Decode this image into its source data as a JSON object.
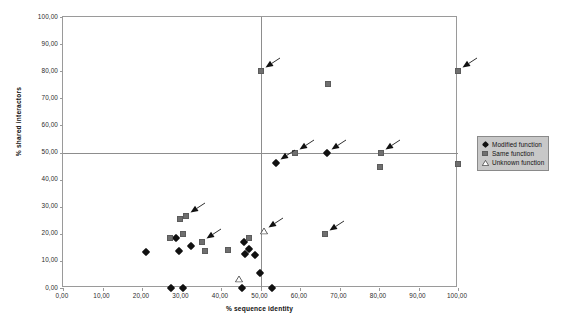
{
  "chart_data": {
    "type": "scatter",
    "title": "",
    "xlabel": "% sequence identity",
    "ylabel": "% shared interactors",
    "xlim": [
      0,
      100
    ],
    "ylim": [
      0,
      100
    ],
    "xticks": [
      "0,00",
      "10,00",
      "20,00",
      "30,00",
      "40,00",
      "50,00",
      "60,00",
      "70,00",
      "80,00",
      "90,00",
      "100,00"
    ],
    "xtick_values": [
      0,
      10,
      20,
      30,
      40,
      50,
      60,
      70,
      80,
      90,
      100
    ],
    "yticks": [
      "0,00",
      "10,00",
      "20,00",
      "30,00",
      "40,00",
      "50,00",
      "60,00",
      "70,00",
      "80,00",
      "90,00",
      "100,00"
    ],
    "ytick_values": [
      0,
      10,
      20,
      30,
      40,
      50,
      60,
      70,
      80,
      90,
      100
    ],
    "grid": false,
    "reference_lines": {
      "horizontal": [
        50
      ],
      "vertical": [
        50
      ]
    },
    "legend_position": "right",
    "series": [
      {
        "name": "Modified function",
        "marker": "diamond",
        "color": "#111111",
        "points": [
          {
            "x": 21.0,
            "y": 13.3
          },
          {
            "x": 27.3,
            "y": 0.0
          },
          {
            "x": 28.7,
            "y": 18.5
          },
          {
            "x": 29.3,
            "y": 13.7
          },
          {
            "x": 30.3,
            "y": 0.0
          },
          {
            "x": 32.3,
            "y": 15.5
          },
          {
            "x": 45.3,
            "y": 0.0
          },
          {
            "x": 45.8,
            "y": 17.0
          },
          {
            "x": 46.0,
            "y": 12.6
          },
          {
            "x": 47.0,
            "y": 14.3
          },
          {
            "x": 48.6,
            "y": 12.0
          },
          {
            "x": 49.8,
            "y": 5.4
          },
          {
            "x": 53.0,
            "y": 0.0
          },
          {
            "x": 53.8,
            "y": 46.2
          },
          {
            "x": 66.8,
            "y": 49.8
          }
        ]
      },
      {
        "name": "Same function",
        "marker": "square",
        "color": "#6f6f6f",
        "points": [
          {
            "x": 27.0,
            "y": 18.5
          },
          {
            "x": 29.6,
            "y": 25.4
          },
          {
            "x": 31.2,
            "y": 26.6
          },
          {
            "x": 30.5,
            "y": 20.0
          },
          {
            "x": 35.3,
            "y": 17.0
          },
          {
            "x": 36.0,
            "y": 13.8
          },
          {
            "x": 41.8,
            "y": 13.9
          },
          {
            "x": 47.0,
            "y": 18.4
          },
          {
            "x": 50.0,
            "y": 80.0
          },
          {
            "x": 58.8,
            "y": 49.8
          },
          {
            "x": 66.3,
            "y": 20.0
          },
          {
            "x": 67.0,
            "y": 75.2
          },
          {
            "x": 80.4,
            "y": 49.8
          },
          {
            "x": 80.2,
            "y": 44.5
          },
          {
            "x": 100.0,
            "y": 80.0
          },
          {
            "x": 100.0,
            "y": 45.6
          }
        ]
      },
      {
        "name": "Unknown function",
        "marker": "triangle",
        "color": "#ffffff",
        "points": [
          {
            "x": 44.6,
            "y": 3.3
          },
          {
            "x": 51.0,
            "y": 21.0
          }
        ]
      }
    ],
    "annotations": [
      {
        "label": "arrow",
        "target_x": 50.0,
        "target_y": 80.0
      },
      {
        "label": "arrow",
        "target_x": 100.0,
        "target_y": 80.0
      },
      {
        "label": "arrow",
        "target_x": 58.8,
        "target_y": 49.8
      },
      {
        "label": "arrow",
        "target_x": 66.8,
        "target_y": 49.8
      },
      {
        "label": "arrow",
        "target_x": 80.4,
        "target_y": 49.8
      },
      {
        "label": "arrow",
        "target_x": 31.2,
        "target_y": 26.6
      },
      {
        "label": "arrow",
        "target_x": 35.3,
        "target_y": 17.0
      },
      {
        "label": "arrow",
        "target_x": 51.0,
        "target_y": 21.0
      },
      {
        "label": "arrow",
        "target_x": 66.3,
        "target_y": 20.0
      },
      {
        "label": "arrow",
        "target_x": 53.8,
        "target_y": 46.2
      }
    ]
  },
  "legend": {
    "items": [
      {
        "label": "Modified function",
        "marker": "diamond"
      },
      {
        "label": "Same function",
        "marker": "square"
      },
      {
        "label": "Unknown function",
        "marker": "triangle"
      }
    ]
  }
}
